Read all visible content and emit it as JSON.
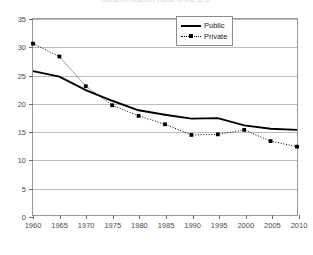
{
  "chart_data": {
    "type": "line",
    "title": "Student-Teacher Ratio in the U.S.",
    "xlabel": "",
    "ylabel": "",
    "x": [
      1960,
      1965,
      1970,
      1975,
      1980,
      1985,
      1990,
      1995,
      2000,
      2005,
      2010
    ],
    "xtick_labels": [
      "1960",
      "1965",
      "1970",
      "1975",
      "1980",
      "1985",
      "1990",
      "1995",
      "2000",
      "2005",
      "2010"
    ],
    "ytick_labels": [
      "0",
      "5",
      "10",
      "15",
      "20",
      "25",
      "30",
      "35"
    ],
    "yticks": [
      0,
      5,
      10,
      15,
      20,
      25,
      30,
      35
    ],
    "ylim": [
      0,
      35
    ],
    "xlim": [
      1960,
      2010
    ],
    "grid": "horizontal",
    "legend_position": "top-right",
    "series": [
      {
        "name": "Public",
        "style": "solid",
        "marker": "none",
        "color": "#000000",
        "values": [
          25.7,
          24.7,
          22.3,
          20.4,
          18.7,
          17.9,
          17.2,
          17.3,
          16.0,
          15.4,
          15.2
        ]
      },
      {
        "name": "Private",
        "style": "dotted",
        "marker": "square",
        "color": "#000000",
        "values": [
          30.6,
          28.3,
          23.0,
          19.6,
          17.7,
          16.2,
          14.3,
          14.4,
          15.2,
          13.2,
          12.2
        ]
      }
    ]
  }
}
